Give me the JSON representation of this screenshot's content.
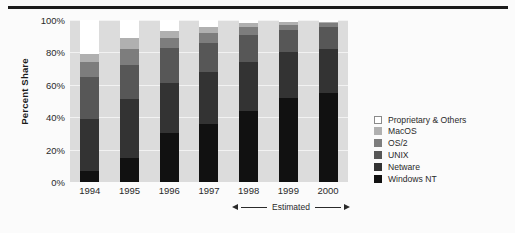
{
  "chart_data": {
    "type": "bar",
    "subtype": "stacked-bar-100pct",
    "title": "",
    "xlabel": "",
    "ylabel": "Percent Share",
    "ylim": [
      0,
      100
    ],
    "ytick_labels": [
      "100%",
      "80%",
      "60%",
      "40%",
      "20%",
      "0%"
    ],
    "ytick_values": [
      100,
      80,
      60,
      40,
      20,
      0
    ],
    "grid": true,
    "legend_position": "right",
    "categories": [
      "1994",
      "1995",
      "1996",
      "1997",
      "1998",
      "1999",
      "2000"
    ],
    "series": [
      {
        "name": "Windows NT",
        "color": "#111111",
        "values": [
          7,
          15,
          30,
          36,
          44,
          52,
          55
        ]
      },
      {
        "name": "Netware",
        "color": "#333333",
        "values": [
          32,
          36,
          31,
          32,
          30,
          28,
          27
        ]
      },
      {
        "name": "UNIX",
        "color": "#575757",
        "values": [
          26,
          21,
          22,
          18,
          17,
          14,
          14
        ]
      },
      {
        "name": "OS/2",
        "color": "#7d7d7d",
        "values": [
          9,
          10,
          6,
          6,
          5,
          3,
          2
        ]
      },
      {
        "name": "MacOS",
        "color": "#b0b0b0",
        "values": [
          5,
          7,
          4,
          4,
          2,
          2,
          1
        ]
      },
      {
        "name": "Proprietary & Others",
        "color": "#ffffff",
        "values": [
          21,
          11,
          7,
          4,
          2,
          1,
          1
        ]
      }
    ],
    "annotations": [
      {
        "text": "Estimated",
        "spans": [
          "1998",
          "2000"
        ],
        "style": "double-arrow"
      }
    ]
  },
  "legend": {
    "items": [
      {
        "label": "Proprietary & Others",
        "color": "#ffffff",
        "bordered": true
      },
      {
        "label": "MacOS",
        "color": "#b0b0b0",
        "bordered": false
      },
      {
        "label": "OS/2",
        "color": "#7d7d7d",
        "bordered": false
      },
      {
        "label": "UNIX",
        "color": "#575757",
        "bordered": false
      },
      {
        "label": "Netware",
        "color": "#333333",
        "bordered": false
      },
      {
        "label": "Windows NT",
        "color": "#111111",
        "bordered": false
      }
    ]
  },
  "annotation": {
    "estimated_label": "Estimated"
  },
  "colors": {
    "plot_background": "#dcdcdc",
    "page_background": "#fbfbfb",
    "gridline": "#f2f2f2",
    "rule": "#1c1c1c",
    "text": "#2a2a2a"
  }
}
